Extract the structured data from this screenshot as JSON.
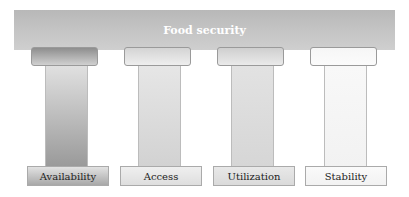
{
  "title": "Food security",
  "pillars": [
    {
      "label": "Availability",
      "capital": "linear-gradient(180deg,#8e8e8e,#d0d0d0)",
      "column": "linear-gradient(180deg,#e0e0e0,#9a9a9a)",
      "base": "linear-gradient(180deg,#e2e2e2,#a8a8a8)"
    },
    {
      "label": "Access",
      "capital": "linear-gradient(180deg,#d4d4d4,#eeeeee)",
      "column": "linear-gradient(180deg,#e6e6e6,#d2d2d2)",
      "base": "linear-gradient(180deg,#efefef,#dedede)"
    },
    {
      "label": "Utilization",
      "capital": "linear-gradient(180deg,#cfcfcf,#eaeaea)",
      "column": "linear-gradient(180deg,#e2e2e2,#d6d6d6)",
      "base": "linear-gradient(180deg,#e8e8e8,#dadada)"
    },
    {
      "label": "Stability",
      "capital": "linear-gradient(180deg,#f6f6f6,#fbfbfb)",
      "column": "linear-gradient(180deg,#f8f8f8,#f2f2f2)",
      "base": "linear-gradient(180deg,#fafafa,#f2f2f2)"
    }
  ]
}
